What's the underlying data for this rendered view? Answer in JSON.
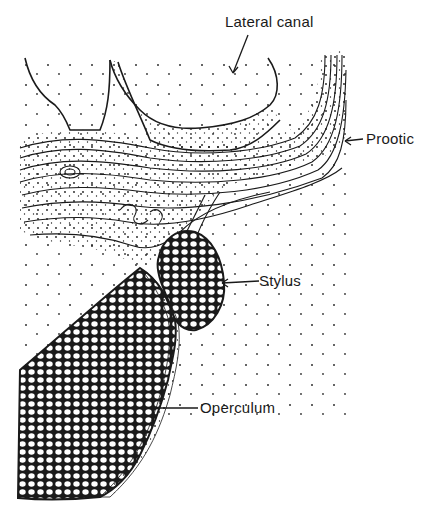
{
  "figure": {
    "labels": {
      "lateral_canal": "Lateral canal",
      "prootic": "Prootic",
      "stylus": "Stylus",
      "operculum": "Operculum"
    },
    "colors": {
      "ink": "#1a1a1a",
      "paper": "#ffffff"
    }
  }
}
